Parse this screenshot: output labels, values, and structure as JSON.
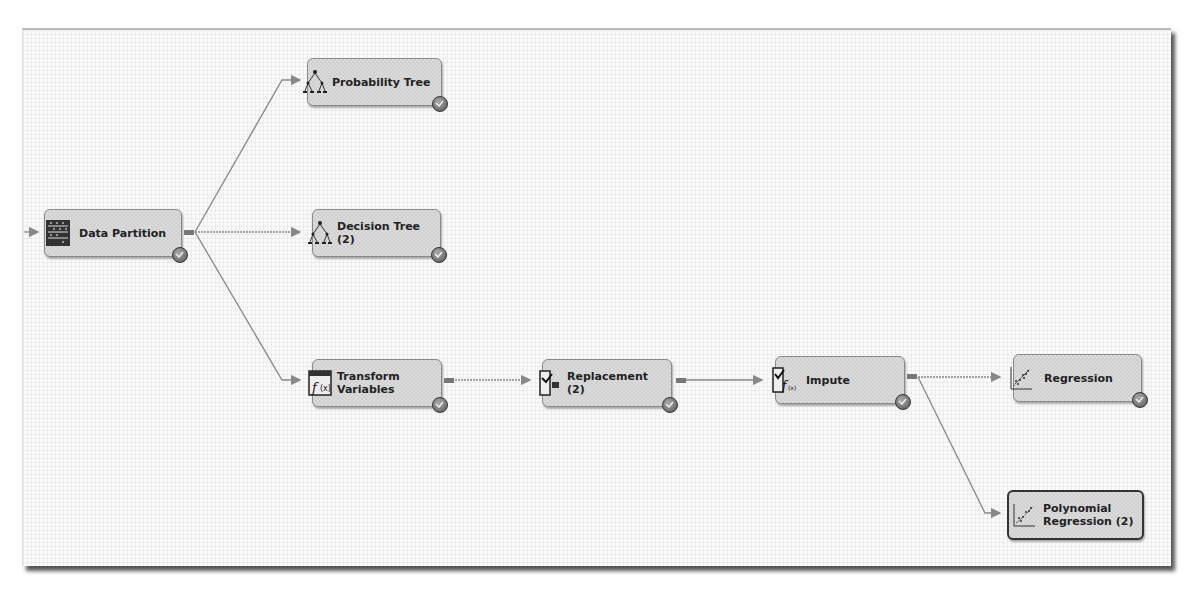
{
  "diagram": {
    "nodes": [
      {
        "id": "data-partition",
        "label": "Data Partition",
        "icon": "data-partition-icon",
        "status": "completed"
      },
      {
        "id": "probability-tree",
        "label": "Probability Tree",
        "icon": "tree-icon",
        "status": "completed"
      },
      {
        "id": "decision-tree-2",
        "label": "Decision Tree\n(2)",
        "icon": "tree-icon",
        "status": "completed"
      },
      {
        "id": "transform-variables",
        "label": "Transform\nVariables",
        "icon": "transform-icon",
        "status": "completed"
      },
      {
        "id": "replacement-2",
        "label": "Replacement\n(2)",
        "icon": "replacement-icon",
        "status": "completed"
      },
      {
        "id": "impute",
        "label": "Impute",
        "icon": "impute-icon",
        "status": "completed"
      },
      {
        "id": "regression",
        "label": "Regression",
        "icon": "regression-icon",
        "status": "completed"
      },
      {
        "id": "polynomial-regression-2",
        "label": "Polynomial\nRegression (2)",
        "icon": "regression-icon",
        "status": "selected"
      }
    ],
    "edges": [
      [
        "data-partition",
        "probability-tree"
      ],
      [
        "data-partition",
        "decision-tree-2"
      ],
      [
        "data-partition",
        "transform-variables"
      ],
      [
        "transform-variables",
        "replacement-2"
      ],
      [
        "replacement-2",
        "impute"
      ],
      [
        "impute",
        "regression"
      ],
      [
        "impute",
        "polynomial-regression-2"
      ]
    ]
  }
}
